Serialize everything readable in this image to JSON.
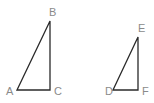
{
  "diagram": {
    "type": "geometry",
    "triangles": [
      {
        "name": "ABC",
        "vertices": [
          {
            "label": "A",
            "x": 17,
            "y": 90
          },
          {
            "label": "B",
            "x": 50,
            "y": 21
          },
          {
            "label": "C",
            "x": 50,
            "y": 90
          }
        ],
        "right_angle_at": "C"
      },
      {
        "name": "DEF",
        "vertices": [
          {
            "label": "D",
            "x": 113,
            "y": 90
          },
          {
            "label": "E",
            "x": 138,
            "y": 37
          },
          {
            "label": "F",
            "x": 138,
            "y": 90
          }
        ],
        "right_angle_at": "F"
      }
    ],
    "labels": {
      "A": "A",
      "B": "B",
      "C": "C",
      "D": "D",
      "E": "E",
      "F": "F"
    },
    "colors": {
      "edge": "#2a2a2a",
      "label": "#8a8a8a",
      "background": "#ffffff"
    }
  }
}
